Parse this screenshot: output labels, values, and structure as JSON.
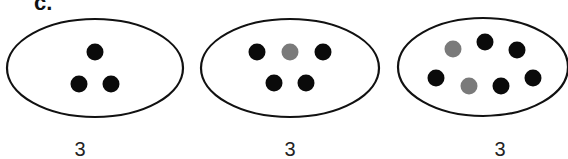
{
  "panel_label": "c.",
  "colors": {
    "black_dot": "#0a0a0a",
    "gray_dot": "#7a7a7a",
    "outline": "#111111"
  },
  "sets": [
    {
      "count_label": "3",
      "ellipse": {
        "cx": 95,
        "cy": 68,
        "rx": 88,
        "ry": 49
      },
      "dots": [
        {
          "cx": 95,
          "cy": 52,
          "color": "black"
        },
        {
          "cx": 79,
          "cy": 84,
          "color": "black"
        },
        {
          "cx": 111,
          "cy": 84,
          "color": "black"
        }
      ]
    },
    {
      "count_label": "3",
      "ellipse": {
        "cx": 290,
        "cy": 68,
        "rx": 89,
        "ry": 49
      },
      "dots": [
        {
          "cx": 257,
          "cy": 52,
          "color": "black"
        },
        {
          "cx": 290,
          "cy": 52,
          "color": "gray"
        },
        {
          "cx": 323,
          "cy": 52,
          "color": "black"
        },
        {
          "cx": 274,
          "cy": 83,
          "color": "black"
        },
        {
          "cx": 306,
          "cy": 83,
          "color": "black"
        }
      ]
    },
    {
      "count_label": "3",
      "ellipse": {
        "cx": 483,
        "cy": 67,
        "rx": 85,
        "ry": 49
      },
      "dots": [
        {
          "cx": 453,
          "cy": 49,
          "color": "gray"
        },
        {
          "cx": 485,
          "cy": 42,
          "color": "black"
        },
        {
          "cx": 517,
          "cy": 50,
          "color": "black"
        },
        {
          "cx": 436,
          "cy": 78,
          "color": "black"
        },
        {
          "cx": 469,
          "cy": 86,
          "color": "gray"
        },
        {
          "cx": 501,
          "cy": 86,
          "color": "black"
        },
        {
          "cx": 533,
          "cy": 78,
          "color": "black"
        }
      ]
    }
  ]
}
